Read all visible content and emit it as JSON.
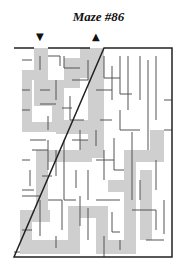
{
  "title": "Maze #86",
  "entrance_arrow": "▼",
  "exit_arrow": "▲",
  "colors": {
    "wall": "#555555",
    "border": "#222222",
    "solution": "#cfcfcf",
    "background": "#ffffff"
  },
  "maze": {
    "x": 14,
    "y": 48,
    "width": 158,
    "height": 209,
    "cell": 8,
    "entrance_x": 41,
    "exit_x": 97
  }
}
